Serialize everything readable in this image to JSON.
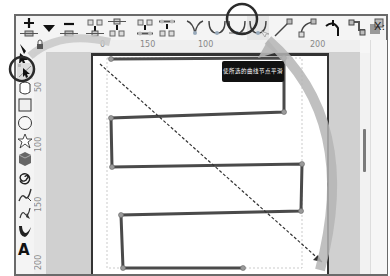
{
  "toolbar": {
    "items": [
      {
        "name": "insert-node-button",
        "label": "Insert new nodes"
      },
      {
        "name": "join-nodes-dropdown",
        "label": "Dropdown"
      },
      {
        "name": "delete-node-button",
        "label": "Delete selected nodes"
      },
      {
        "name": "join-nodes-button",
        "label": "Join selected nodes"
      },
      {
        "name": "break-path-button",
        "label": "Break path at selected nodes"
      },
      {
        "name": "join-segment-button",
        "label": "Join selected endnodes with a new segment"
      },
      {
        "name": "delete-segment-button",
        "label": "Delete segment between two non-endpoint nodes"
      },
      {
        "name": "cusp-node-button",
        "label": "Make selected nodes corner"
      },
      {
        "name": "smooth-node-button",
        "label": "Make selected nodes smooth"
      },
      {
        "name": "symmetric-node-button",
        "label": "Make selected nodes symmetric"
      },
      {
        "name": "auto-smooth-node-button",
        "label": "Make selected nodes auto-smooth"
      },
      {
        "name": "line-segment-button",
        "label": "Make selected segments lines"
      },
      {
        "name": "curve-segment-button",
        "label": "Make selected segments curves"
      },
      {
        "name": "object-to-path-button",
        "label": "Convert selected object to path"
      },
      {
        "name": "stroke-to-path-button",
        "label": "Convert selected object's stroke to paths"
      },
      {
        "name": "path-effect-button",
        "label": "Path effects"
      }
    ],
    "x_label": "X:"
  },
  "rulers": {
    "horizontal": [
      "0",
      "150",
      "100",
      "200"
    ],
    "vertical": [
      "50",
      "100",
      "150",
      "200"
    ]
  },
  "toolbox": {
    "tools": [
      "selector-tool",
      "node-tool",
      "tweak-tool",
      "rectangle-tool",
      "ellipse-tool",
      "star-tool",
      "3d-box-tool",
      "spiral-tool",
      "pencil-tool",
      "pen-tool",
      "calligraphy-tool",
      "text-tool"
    ],
    "active_tool": "node-tool"
  },
  "tooltip": {
    "text": "使所选的曲线节点平滑"
  },
  "annotations": {
    "circle_color": "#2b2b2b",
    "arrow_color": "#b5b5b5"
  },
  "colors": {
    "path_stroke": "#4a4a4a",
    "node_fill": "#9a9a9a",
    "canvas_bg": "#d0d0d0",
    "page_bg": "#ffffff"
  }
}
